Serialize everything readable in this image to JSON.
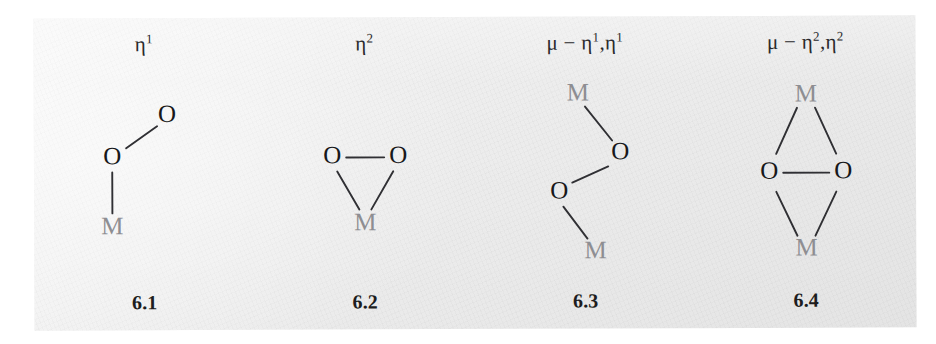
{
  "figure": {
    "background_color": "#eeeeee",
    "page_color": "#ffffff",
    "oxygen_color": "#18181a",
    "metal_color": "#8e8e92",
    "bond_color": "#303034"
  },
  "structures": [
    {
      "id": "6.1",
      "mode_label": "η",
      "mode_superscript": "1",
      "mode_full": "η1",
      "compound_label": "6.1",
      "description": "end-on terminal peroxo, single metal bound to one oxygen",
      "atoms": [
        {
          "element": "O",
          "role": "terminal-oxygen"
        },
        {
          "element": "O",
          "role": "bound-oxygen"
        },
        {
          "element": "M",
          "role": "metal"
        }
      ],
      "bonds": [
        {
          "from": "O-terminal",
          "to": "O-bound"
        },
        {
          "from": "O-bound",
          "to": "M"
        }
      ]
    },
    {
      "id": "6.2",
      "mode_label": "η",
      "mode_superscript": "2",
      "mode_full": "η2",
      "compound_label": "6.2",
      "description": "side-on peroxo, triangular, one metal bound to both oxygens",
      "atoms": [
        {
          "element": "O",
          "role": "oxygen-left"
        },
        {
          "element": "O",
          "role": "oxygen-right"
        },
        {
          "element": "M",
          "role": "metal"
        }
      ],
      "bonds": [
        {
          "from": "O-left",
          "to": "O-right"
        },
        {
          "from": "O-left",
          "to": "M"
        },
        {
          "from": "O-right",
          "to": "M"
        }
      ]
    },
    {
      "id": "6.3",
      "mode_label": "μ − η",
      "mode_full": "μ−η1,η1",
      "compound_label": "6.3",
      "description": "bridging trans zigzag, each metal bound to one oxygen",
      "atoms": [
        {
          "element": "M",
          "role": "metal-top"
        },
        {
          "element": "O",
          "role": "oxygen-upper"
        },
        {
          "element": "O",
          "role": "oxygen-lower"
        },
        {
          "element": "M",
          "role": "metal-bottom"
        }
      ],
      "bonds": [
        {
          "from": "M-top",
          "to": "O-upper"
        },
        {
          "from": "O-upper",
          "to": "O-lower"
        },
        {
          "from": "O-lower",
          "to": "M-bottom"
        }
      ]
    },
    {
      "id": "6.4",
      "mode_label": "μ − η",
      "mode_full": "μ−η2,η2",
      "compound_label": "6.4",
      "description": "side-on bridging butterfly diamond, both metals bound to both oxygens",
      "atoms": [
        {
          "element": "M",
          "role": "metal-top"
        },
        {
          "element": "O",
          "role": "oxygen-left"
        },
        {
          "element": "O",
          "role": "oxygen-right"
        },
        {
          "element": "M",
          "role": "metal-bottom"
        }
      ],
      "bonds": [
        {
          "from": "M-top",
          "to": "O-left"
        },
        {
          "from": "M-top",
          "to": "O-right"
        },
        {
          "from": "O-left",
          "to": "O-right"
        },
        {
          "from": "O-left",
          "to": "M-bottom"
        },
        {
          "from": "O-right",
          "to": "M-bottom"
        }
      ]
    }
  ],
  "mode_parts": {
    "mu_dash": "μ − ",
    "eta": "η",
    "comma": ",",
    "one": "1",
    "two": "2"
  }
}
